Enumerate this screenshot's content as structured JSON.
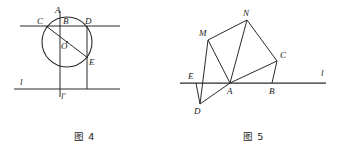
{
  "document": {
    "kind": "geometry-figure-pair",
    "background_color": "#ffffff",
    "ink_color": "#2b2b2b"
  },
  "figure4": {
    "caption": "图 4",
    "description": "Circle with center O, chord CD on a horizontal line, vertical line l' through A and B, diameter from C through O to E, and a lower horizontal line l.",
    "circle": {
      "cx": 67,
      "cy": 42,
      "r": 25
    },
    "center_label": "O",
    "points": [
      {
        "name": "A",
        "label": "A",
        "x": 60,
        "y": 17,
        "label_x": 55,
        "label_y": 13
      },
      {
        "name": "B",
        "label": "B",
        "x": 60,
        "y": 26,
        "label_x": 63,
        "label_y": 24
      },
      {
        "name": "C",
        "label": "C",
        "x": 46,
        "y": 26,
        "label_x": 37,
        "label_y": 24
      },
      {
        "name": "D",
        "label": "D",
        "x": 87,
        "y": 26,
        "label_x": 85,
        "label_y": 24
      },
      {
        "name": "O",
        "label": "O",
        "x": 67,
        "y": 42,
        "label_x": 61,
        "label_y": 49
      },
      {
        "name": "E",
        "label": "E",
        "x": 88,
        "y": 58,
        "label_x": 89,
        "label_y": 65
      }
    ],
    "line_labels": [
      {
        "name": "l",
        "label": "l",
        "x": 20,
        "y": 85
      },
      {
        "name": "l-prime",
        "label": "l'",
        "x": 61,
        "y": 99
      }
    ],
    "segments": [
      {
        "name": "upper-horizontal-line",
        "x1": 20,
        "y1": 26,
        "x2": 120,
        "y2": 26
      },
      {
        "name": "lower-horizontal-line-l",
        "x1": 14,
        "y1": 89,
        "x2": 120,
        "y2": 89
      },
      {
        "name": "vertical-line-l-prime",
        "x1": 60,
        "y1": 11,
        "x2": 60,
        "y2": 97
      },
      {
        "name": "vertical-segment-D-to-lower",
        "x1": 87,
        "y1": 26,
        "x2": 87,
        "y2": 89
      },
      {
        "name": "diameter-C-O-E",
        "x1": 46,
        "y1": 26,
        "x2": 88,
        "y2": 58
      }
    ]
  },
  "figure5": {
    "caption": "图 5",
    "description": "Line l horizontal through E, A and B; quadrilateral M N C A with triangles M A E, A B C, and D A E below the line.",
    "line_label": {
      "name": "l",
      "label": "l",
      "x": 321,
      "y": 76
    },
    "points": [
      {
        "name": "N",
        "label": "N",
        "x": 247,
        "y": 20,
        "label_x": 243,
        "label_y": 16
      },
      {
        "name": "M",
        "label": "M",
        "x": 208,
        "y": 40,
        "label_x": 199,
        "label_y": 36
      },
      {
        "name": "C",
        "label": "C",
        "x": 277,
        "y": 61,
        "label_x": 280,
        "label_y": 58
      },
      {
        "name": "E",
        "label": "E",
        "x": 196,
        "y": 83,
        "label_x": 188,
        "label_y": 79
      },
      {
        "name": "A",
        "label": "A",
        "x": 230,
        "y": 83,
        "label_x": 227,
        "label_y": 94
      },
      {
        "name": "B",
        "label": "B",
        "x": 272,
        "y": 83,
        "label_x": 269,
        "label_y": 94
      },
      {
        "name": "D",
        "label": "D",
        "x": 200,
        "y": 104,
        "label_x": 194,
        "label_y": 114
      }
    ],
    "segments": [
      {
        "name": "line-l",
        "x1": 180,
        "y1": 83,
        "x2": 326,
        "y2": 83,
        "thick": true
      },
      {
        "name": "segment-M-N",
        "x1": 208,
        "y1": 40,
        "x2": 247,
        "y2": 20
      },
      {
        "name": "segment-N-C",
        "x1": 247,
        "y1": 20,
        "x2": 277,
        "y2": 61
      },
      {
        "name": "segment-N-A",
        "x1": 247,
        "y1": 20,
        "x2": 230,
        "y2": 83
      },
      {
        "name": "segment-M-A",
        "x1": 208,
        "y1": 40,
        "x2": 230,
        "y2": 83
      },
      {
        "name": "segment-M-D",
        "x1": 208,
        "y1": 40,
        "x2": 200,
        "y2": 104
      },
      {
        "name": "segment-A-C",
        "x1": 230,
        "y1": 83,
        "x2": 277,
        "y2": 61
      },
      {
        "name": "segment-C-B",
        "x1": 277,
        "y1": 61,
        "x2": 272,
        "y2": 83
      },
      {
        "name": "segment-E-D",
        "x1": 196,
        "y1": 83,
        "x2": 200,
        "y2": 104
      },
      {
        "name": "segment-D-A",
        "x1": 200,
        "y1": 104,
        "x2": 230,
        "y2": 83
      }
    ]
  }
}
